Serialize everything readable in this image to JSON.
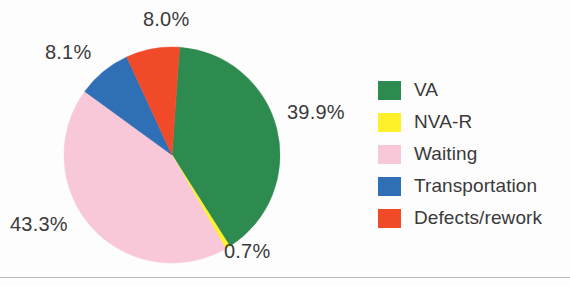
{
  "chart_data": {
    "type": "pie",
    "title": "",
    "subtitle": "",
    "xlabel": "",
    "ylabel": "",
    "grid": false,
    "legend_position": "right",
    "unit": "%",
    "start_angle_deg": 4,
    "direction": "clockwise",
    "categories": [
      "VA",
      "NVA-R",
      "Waiting",
      "Transportation",
      "Defects/rework"
    ],
    "values": [
      39.9,
      0.7,
      43.3,
      8.1,
      8.0
    ],
    "value_labels": [
      "39.9%",
      "0.7%",
      "43.3%",
      "8.1%",
      "8.0%"
    ],
    "colors": [
      "#2e8b4f",
      "#fff02a",
      "#f9c8d8",
      "#2e6fb5",
      "#f04a28"
    ],
    "slices": [
      {
        "label": "VA",
        "value": 39.9,
        "display": "39.9%",
        "color": "#2e8b4f"
      },
      {
        "label": "NVA-R",
        "value": 0.7,
        "display": "0.7%",
        "color": "#fff02a"
      },
      {
        "label": "Waiting",
        "value": 43.3,
        "display": "43.3%",
        "color": "#f9c8d8"
      },
      {
        "label": "Transportation",
        "value": 8.1,
        "display": "8.1%",
        "color": "#2e6fb5"
      },
      {
        "label": "Defects/rework",
        "value": 8.0,
        "display": "8.0%",
        "color": "#f04a28"
      }
    ]
  },
  "labels": {
    "va": "39.9%",
    "nvar": "0.7%",
    "waiting": "43.3%",
    "transportation": "8.1%",
    "defects": "8.0%"
  },
  "legend": {
    "items": [
      {
        "label": "VA",
        "color": "#2e8b4f"
      },
      {
        "label": "NVA-R",
        "color": "#fff02a"
      },
      {
        "label": "Waiting",
        "color": "#f9c8d8"
      },
      {
        "label": "Transportation",
        "color": "#2e6fb5"
      },
      {
        "label": "Defects/rework",
        "color": "#f04a28"
      }
    ]
  },
  "style": {
    "background": "#fdfdfd",
    "text_color": "#3a3a3a",
    "rule_color": "#b9b9b9"
  }
}
